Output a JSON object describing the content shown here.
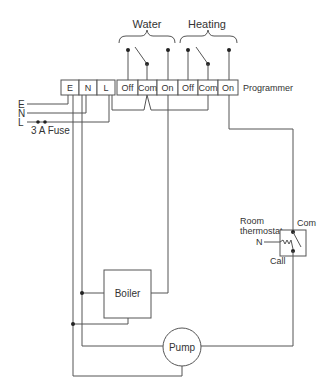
{
  "diagram": {
    "type": "wiring-diagram",
    "groups": {
      "water": "Water",
      "heating": "Heating"
    },
    "programmer": {
      "label": "Programmer",
      "terminals": [
        "E",
        "N",
        "L",
        "Off",
        "Com",
        "On",
        "Off",
        "Com",
        "On"
      ]
    },
    "supply": {
      "lines": [
        "E",
        "N",
        "L"
      ],
      "fuse_label": "3 A Fuse"
    },
    "thermostat": {
      "label_line1": "Room",
      "label_line2": "thermostat",
      "com_label": "Com",
      "call_label": "Call",
      "n_label": "N"
    },
    "boiler": {
      "label": "Boiler"
    },
    "pump": {
      "label": "Pump"
    },
    "colors": {
      "line": "#555555",
      "dot": "#222222",
      "text": "#333333",
      "background": "#ffffff"
    }
  }
}
